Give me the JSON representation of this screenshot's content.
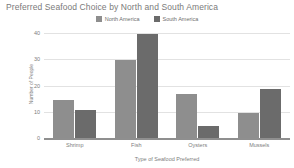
{
  "chart_data": {
    "type": "bar",
    "title": "Preferred Seafood Choice by North and South America",
    "xlabel": "Type of Seafood Preferred",
    "ylabel": "Number of People",
    "categories": [
      "Shrimp",
      "Fish",
      "Oysters",
      "Mussels"
    ],
    "series": [
      {
        "name": "North America",
        "values": [
          15,
          30,
          17,
          10
        ],
        "color": "#8e8e8e"
      },
      {
        "name": "South America",
        "values": [
          11,
          40,
          5,
          19
        ],
        "color": "#6b6b6b"
      }
    ],
    "ylim": [
      0,
      42
    ],
    "yticks": [
      0,
      10,
      20,
      30,
      40
    ],
    "ytick_labels": [
      "0",
      "10",
      "20",
      "30",
      "40"
    ],
    "grid": true,
    "legend_position": "top-center"
  }
}
